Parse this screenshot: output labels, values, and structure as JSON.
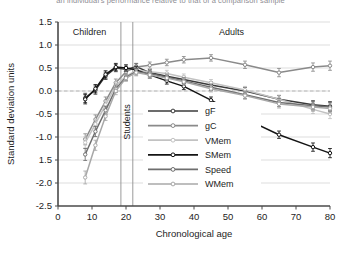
{
  "caption_cut": "an individual's performance relative to that of a comparison sample",
  "axes": {
    "ylabel": "Standard deviation units",
    "xlabel": "Chronological age",
    "yticks": [
      "1.5",
      "1.0",
      "0.5",
      "0.0",
      "-0.5",
      "-1.0",
      "1.5",
      "-2.0",
      "-2.5"
    ],
    "ytick_values": [
      1.5,
      1.0,
      0.5,
      0.0,
      -0.5,
      -1.0,
      -1.5,
      -2.0,
      -2.5
    ],
    "xticks": [
      "0",
      "10",
      "20",
      "30",
      "40",
      "50",
      "60",
      "70",
      "80"
    ],
    "xtick_values": [
      0,
      10,
      20,
      30,
      40,
      50,
      60,
      70,
      80
    ],
    "ylim": [
      -2.5,
      1.5
    ],
    "xlim": [
      0,
      80
    ],
    "zero_reference": "0.0"
  },
  "bands": [
    {
      "label": "Children",
      "start": 0,
      "end": 18.5
    },
    {
      "label": "Students",
      "start": 18.5,
      "end": 22.0,
      "orientation": "vertical"
    },
    {
      "label": "Adults",
      "start": 22.0,
      "end": 80
    }
  ],
  "legend": {
    "position": "bottom-center",
    "items": [
      {
        "label": "gF",
        "color": "#3b3b3b"
      },
      {
        "label": "gC",
        "color": "#8a8a8a"
      },
      {
        "label": "VMem",
        "color": "#c2c2c2"
      },
      {
        "label": "SMem",
        "color": "#141414"
      },
      {
        "label": "Speed",
        "color": "#6e6e6e"
      },
      {
        "label": "WMem",
        "color": "#a8a8a8"
      }
    ]
  },
  "chart_data": {
    "type": "line",
    "title": "",
    "xlabel": "Chronological age",
    "ylabel": "Standard deviation units",
    "xlim": [
      0,
      80
    ],
    "ylim": [
      -2.5,
      1.5
    ],
    "grid": true,
    "legend_position": "bottom-center",
    "x": [
      8,
      11,
      14,
      17,
      20,
      23,
      27,
      32,
      37,
      45,
      55,
      65,
      75,
      80
    ],
    "series": [
      {
        "name": "gF",
        "color": "#3b3b3b",
        "values": [
          -0.15,
          0.02,
          0.33,
          0.5,
          0.47,
          0.53,
          0.4,
          0.32,
          0.25,
          0.13,
          0.0,
          -0.18,
          -0.3,
          -0.33
        ],
        "errors": [
          0.1,
          0.09,
          0.08,
          0.08,
          0.07,
          0.07,
          0.07,
          0.07,
          0.07,
          0.07,
          0.08,
          0.08,
          0.09,
          0.1
        ]
      },
      {
        "name": "gC",
        "color": "#8a8a8a",
        "values": [
          -1.05,
          -0.62,
          -0.22,
          0.18,
          0.42,
          0.52,
          0.56,
          0.62,
          0.68,
          0.72,
          0.57,
          0.4,
          0.52,
          0.55
        ],
        "errors": [
          0.12,
          0.1,
          0.09,
          0.08,
          0.07,
          0.07,
          0.07,
          0.07,
          0.07,
          0.07,
          0.08,
          0.09,
          0.09,
          0.1
        ]
      },
      {
        "name": "VMem",
        "color": "#c2c2c2",
        "values": [
          -1.12,
          -0.72,
          -0.3,
          0.12,
          0.32,
          0.45,
          0.42,
          0.38,
          0.3,
          0.18,
          0.02,
          -0.18,
          -0.4,
          -0.5
        ],
        "errors": [
          0.12,
          0.1,
          0.09,
          0.08,
          0.07,
          0.07,
          0.07,
          0.07,
          0.07,
          0.07,
          0.08,
          0.09,
          0.09,
          0.1
        ]
      },
      {
        "name": "SMem",
        "color": "#141414",
        "values": [
          -0.18,
          0.05,
          0.36,
          0.52,
          0.5,
          0.46,
          0.35,
          0.22,
          0.1,
          -0.2,
          -0.6,
          -0.95,
          -1.22,
          -1.35
        ],
        "errors": [
          0.1,
          0.09,
          0.08,
          0.08,
          0.07,
          0.07,
          0.07,
          0.07,
          0.07,
          0.07,
          0.08,
          0.08,
          0.09,
          0.1
        ]
      },
      {
        "name": "Speed",
        "color": "#6e6e6e",
        "values": [
          -1.38,
          -0.88,
          -0.42,
          0.05,
          0.3,
          0.42,
          0.38,
          0.3,
          0.22,
          0.08,
          -0.08,
          -0.25,
          -0.32,
          -0.35
        ],
        "errors": [
          0.13,
          0.11,
          0.09,
          0.08,
          0.07,
          0.07,
          0.07,
          0.07,
          0.07,
          0.07,
          0.08,
          0.09,
          0.09,
          0.1
        ]
      },
      {
        "name": "WMem",
        "color": "#a8a8a8",
        "values": [
          -1.88,
          -1.18,
          -0.55,
          0.0,
          0.28,
          0.4,
          0.35,
          0.28,
          0.2,
          0.05,
          -0.1,
          -0.28,
          -0.35,
          -0.38
        ],
        "errors": [
          0.14,
          0.11,
          0.09,
          0.08,
          0.07,
          0.07,
          0.07,
          0.07,
          0.07,
          0.07,
          0.08,
          0.09,
          0.09,
          0.1
        ]
      }
    ]
  }
}
